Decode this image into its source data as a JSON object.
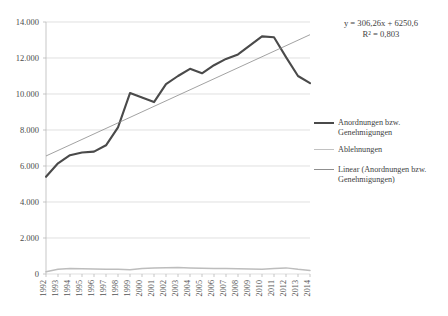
{
  "chart_data": {
    "type": "line",
    "title": "",
    "subtitle": "",
    "xlabel": "",
    "ylabel": "",
    "grid": true,
    "legend_position": "right",
    "ylim": [
      0,
      14000
    ],
    "yticks": [
      0,
      2000,
      4000,
      6000,
      8000,
      10000,
      12000,
      14000
    ],
    "ytick_labels": [
      "0",
      "2.000",
      "4.000",
      "6.000",
      "8.000",
      "10.000",
      "12.000",
      "14.000"
    ],
    "categories": [
      "1992",
      "1993",
      "1994",
      "1995",
      "1996",
      "1997",
      "1998",
      "1999",
      "2000",
      "2001",
      "2002",
      "2003",
      "2004",
      "2005",
      "2006",
      "2007",
      "2008",
      "2009",
      "2010",
      "2011",
      "2012",
      "2013",
      "2014"
    ],
    "series": [
      {
        "name": "Anordnungen bzw. Genehmigungen",
        "color": "#4a4a4a",
        "values": [
          5400,
          6150,
          6600,
          6750,
          6800,
          7150,
          8150,
          10050,
          9800,
          9550,
          10550,
          11000,
          11400,
          11150,
          11600,
          11950,
          12200,
          12700,
          13200,
          13150,
          12050,
          11000,
          10600
        ]
      },
      {
        "name": "Ablehnungen",
        "color": "#bdbdbd",
        "values": [
          120,
          260,
          300,
          290,
          280,
          270,
          270,
          240,
          300,
          330,
          350,
          360,
          340,
          320,
          310,
          300,
          290,
          280,
          270,
          300,
          340,
          260,
          200
        ]
      }
    ],
    "trendline": {
      "name": "Linear (Anordnungen bzw. Genehmigungen)",
      "color": "#8a8a8a",
      "slope": 306.26,
      "intercept": 6250.6,
      "r_squared": 0.803,
      "equation_text": "y = 306,26x + 6250,6",
      "r_squared_text": "R² = 0,803",
      "start_value": 6556.86,
      "end_value": 13294.58
    }
  },
  "legend": {
    "items": [
      {
        "swatch": "sw-main",
        "line1": "Anordnungen bzw.",
        "line2": "Genehmigungen"
      },
      {
        "swatch": "sw-second",
        "line1": "Ablehnungen",
        "line2": ""
      },
      {
        "swatch": "sw-trend",
        "line1": "Linear (Anordnungen bzw.",
        "line2": "Genehmigungen)"
      }
    ]
  },
  "annotation": {
    "equation": "y = 306,26x + 6250,6",
    "r_squared": "R² = 0,803"
  }
}
